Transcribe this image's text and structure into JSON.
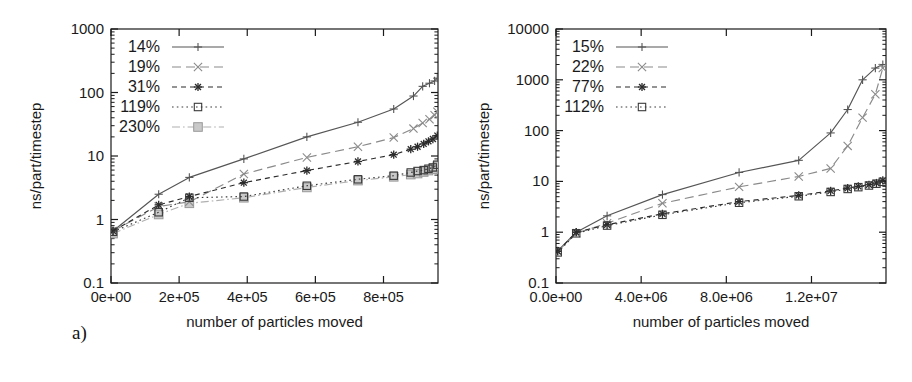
{
  "figure": {
    "background": "#ffffff",
    "ink": "#1a1a1a"
  },
  "panels": [
    {
      "id": "a",
      "caption": "a)",
      "xlabel": "number of particles moved",
      "ylabel": "ns/part/timestep",
      "xticks": [
        "0e+00",
        "2e+05",
        "4e+05",
        "6e+05",
        "8e+05"
      ],
      "yticks": [
        "0.1",
        "1",
        "10",
        "100",
        "1000"
      ],
      "legend": [
        "14%",
        "19%",
        "31%",
        "119%",
        "230%"
      ]
    },
    {
      "id": "b",
      "caption": "b)",
      "xlabel": "number of particles moved",
      "ylabel": "ns/part/timestep",
      "xticks": [
        "0.0e+00",
        "4.0e+06",
        "8.0e+06",
        "1.2e+07"
      ],
      "yticks": [
        "0.1",
        "1",
        "10",
        "100",
        "1000",
        "10000"
      ],
      "legend": [
        "15%",
        "22%",
        "77%",
        "112%"
      ]
    }
  ],
  "chart_data": [
    {
      "type": "line",
      "panel": "a",
      "title": "",
      "xlabel": "number of particles moved",
      "ylabel": "ns/part/timestep",
      "yscale": "log",
      "xlim": [
        0,
        960000
      ],
      "ylim": [
        0.1,
        1000
      ],
      "grid": false,
      "legend_position": "top-left",
      "xticks": [
        0,
        200000,
        400000,
        600000,
        800000
      ],
      "xtick_labels": [
        "0e+00",
        "2e+05",
        "4e+05",
        "6e+05",
        "8e+05"
      ],
      "yticks": [
        0.1,
        1,
        10,
        100,
        1000
      ],
      "ytick_labels": [
        "0.1",
        "1",
        "10",
        "100",
        "1000"
      ],
      "series": [
        {
          "name": "14%",
          "marker": "plus",
          "dash": "solid",
          "color": "#555555",
          "x": [
            6000,
            140000,
            230000,
            390000,
            575000,
            725000,
            830000,
            888000,
            915000,
            935000,
            950000,
            958000
          ],
          "y": [
            0.66,
            2.5,
            4.6,
            9.0,
            20.0,
            34.0,
            55.0,
            88.0,
            125.0,
            140.0,
            152.0,
            168.0
          ]
        },
        {
          "name": "19%",
          "marker": "x",
          "dash": "dash-long",
          "color": "#8a8a8a",
          "x": [
            6000,
            140000,
            230000,
            390000,
            575000,
            725000,
            830000,
            888000,
            915000,
            935000,
            950000,
            958000
          ],
          "y": [
            0.66,
            1.6,
            1.9,
            5.2,
            9.5,
            14.0,
            19.5,
            27.0,
            33.0,
            38.0,
            44.0,
            50.0
          ]
        },
        {
          "name": "31%",
          "marker": "asterisk",
          "dash": "dash-short",
          "color": "#2b2b2b",
          "x": [
            6000,
            140000,
            230000,
            390000,
            575000,
            725000,
            830000,
            880000,
            900000,
            918000,
            932000,
            945000,
            958000
          ],
          "y": [
            0.66,
            1.7,
            2.3,
            3.8,
            5.9,
            8.2,
            10.5,
            12.8,
            14.0,
            15.5,
            17.0,
            18.5,
            21.0
          ]
        },
        {
          "name": "119%",
          "marker": "square",
          "dash": "dotted",
          "color": "#3a3a3a",
          "x": [
            6000,
            140000,
            230000,
            390000,
            575000,
            725000,
            830000,
            880000,
            900000,
            918000,
            932000,
            945000,
            958000
          ],
          "y": [
            0.64,
            1.3,
            2.2,
            2.3,
            3.4,
            4.3,
            4.9,
            5.5,
            5.8,
            6.0,
            6.3,
            6.6,
            7.3
          ]
        },
        {
          "name": "230%",
          "marker": "filled-square",
          "dash": "dash-dot",
          "color": "#b0b0b0",
          "x": [
            6000,
            140000,
            230000,
            390000,
            575000,
            725000,
            830000,
            880000,
            900000,
            918000,
            932000,
            945000,
            958000
          ],
          "y": [
            0.6,
            1.2,
            1.8,
            2.2,
            3.2,
            4.1,
            4.7,
            5.1,
            5.3,
            5.6,
            5.9,
            6.2,
            6.9
          ]
        }
      ]
    },
    {
      "type": "line",
      "panel": "b",
      "title": "",
      "xlabel": "number of particles moved",
      "ylabel": "ns/part/timestep",
      "yscale": "log",
      "xlim": [
        0,
        15500000
      ],
      "ylim": [
        0.1,
        10000
      ],
      "grid": false,
      "legend_position": "top-left",
      "xticks": [
        0,
        4000000,
        8000000,
        12000000
      ],
      "xtick_labels": [
        "0.0e+00",
        "4.0e+06",
        "8.0e+06",
        "1.2e+07"
      ],
      "yticks": [
        0.1,
        1,
        10,
        100,
        1000,
        10000
      ],
      "ytick_labels": [
        "0.1",
        "1",
        "10",
        "100",
        "1000",
        "10000"
      ],
      "series": [
        {
          "name": "15%",
          "marker": "plus",
          "dash": "solid",
          "color": "#555555",
          "x": [
            80000,
            950000,
            2400000,
            5000000,
            8600000,
            11400000,
            12900000,
            13700000,
            14400000,
            15000000,
            15350000
          ],
          "y": [
            0.43,
            1.0,
            2.1,
            5.5,
            15.0,
            26.0,
            90.0,
            260.0,
            1000.0,
            1700.0,
            2000.0
          ]
        },
        {
          "name": "22%",
          "marker": "x",
          "dash": "dash-long",
          "color": "#8a8a8a",
          "x": [
            80000,
            950000,
            2400000,
            5000000,
            8600000,
            11400000,
            12900000,
            13700000,
            14400000,
            15000000,
            15350000
          ],
          "y": [
            0.42,
            0.95,
            1.5,
            3.7,
            7.8,
            12.5,
            18.0,
            50.0,
            180.0,
            520.0,
            1700.0
          ]
        },
        {
          "name": "77%",
          "marker": "asterisk",
          "dash": "dash-short",
          "color": "#2b2b2b",
          "x": [
            80000,
            950000,
            2400000,
            5000000,
            8600000,
            11400000,
            12900000,
            13700000,
            14200000,
            14700000,
            15050000,
            15350000
          ],
          "y": [
            0.42,
            1.0,
            1.4,
            2.3,
            4.0,
            5.3,
            6.5,
            7.4,
            8.0,
            8.6,
            9.3,
            10.5
          ]
        },
        {
          "name": "112%",
          "marker": "square",
          "dash": "dotted",
          "color": "#3a3a3a",
          "x": [
            80000,
            950000,
            2400000,
            5000000,
            8600000,
            11400000,
            12900000,
            13700000,
            14200000,
            14700000,
            15050000,
            15350000
          ],
          "y": [
            0.4,
            0.95,
            1.35,
            2.2,
            3.8,
            5.1,
            6.2,
            7.1,
            7.7,
            8.3,
            9.0,
            9.8
          ]
        }
      ]
    }
  ]
}
